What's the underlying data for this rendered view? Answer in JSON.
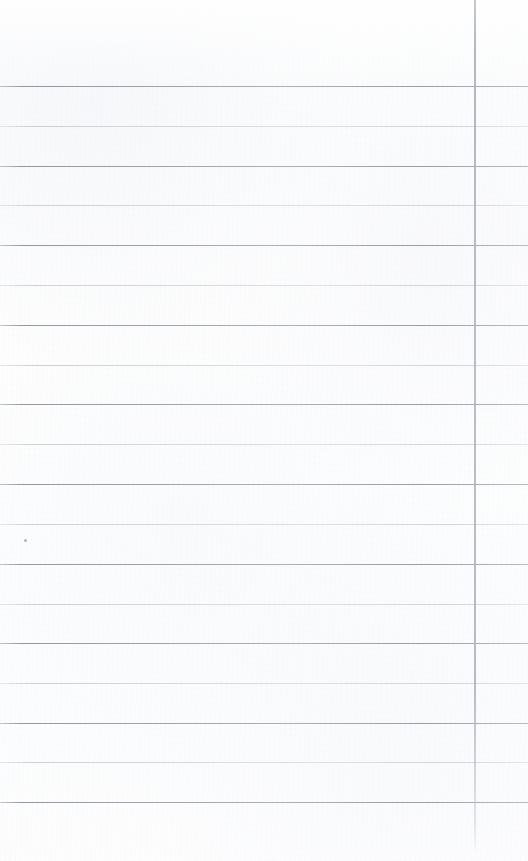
{
  "document": {
    "kind": "blank-ruled-paper-scan",
    "title": "Blank Ruled Paper Scan",
    "width": 528,
    "height": 861,
    "text_content": "",
    "handwriting_present": "none",
    "printed_text_present": "none"
  },
  "colors": {
    "background": "#fdfdfe",
    "paper_tint": "#fbfcfd",
    "rule_dark": "#8a9099",
    "rule_light": "#c0c5ce",
    "margin_line": "#aeb4be",
    "speck": "#787c85"
  },
  "layout": {
    "header_blank_height": 86,
    "first_rule_y": 86,
    "rule_spacing": 39.8,
    "rule_count": 19,
    "rules_span_full_width": true,
    "left_margin_line_present": false
  },
  "margin_line": {
    "name": "right margin rule",
    "x": 474,
    "y_start": 0,
    "y_end": 851,
    "orientation": "vertical",
    "thickness": 2
  },
  "rules": [
    {
      "index": 1,
      "y": 86,
      "weight": "dark"
    },
    {
      "index": 2,
      "y": 126,
      "weight": "light"
    },
    {
      "index": 3,
      "y": 166,
      "weight": "dark"
    },
    {
      "index": 4,
      "y": 205,
      "weight": "light"
    },
    {
      "index": 5,
      "y": 245,
      "weight": "dark"
    },
    {
      "index": 6,
      "y": 285,
      "weight": "light"
    },
    {
      "index": 7,
      "y": 325,
      "weight": "dark"
    },
    {
      "index": 8,
      "y": 365,
      "weight": "light"
    },
    {
      "index": 9,
      "y": 404,
      "weight": "dark"
    },
    {
      "index": 10,
      "y": 444,
      "weight": "light"
    },
    {
      "index": 11,
      "y": 484,
      "weight": "dark"
    },
    {
      "index": 12,
      "y": 524,
      "weight": "light"
    },
    {
      "index": 13,
      "y": 564,
      "weight": "dark"
    },
    {
      "index": 14,
      "y": 604,
      "weight": "light"
    },
    {
      "index": 15,
      "y": 643,
      "weight": "dark"
    },
    {
      "index": 16,
      "y": 683,
      "weight": "light"
    },
    {
      "index": 17,
      "y": 723,
      "weight": "dark"
    },
    {
      "index": 18,
      "y": 762,
      "weight": "light"
    },
    {
      "index": 19,
      "y": 802,
      "weight": "dark"
    }
  ],
  "blemishes": [
    {
      "name": "speck",
      "x": 24,
      "y": 539,
      "size": 3
    }
  ]
}
